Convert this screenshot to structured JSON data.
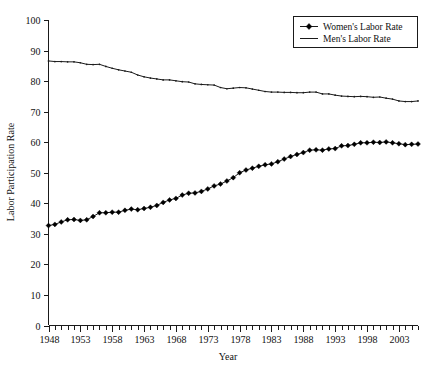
{
  "chart_data": {
    "type": "line",
    "title": "",
    "xlabel": "Year",
    "ylabel": "Labor Participation Rate",
    "xlim": [
      1948,
      2006
    ],
    "ylim": [
      0,
      100
    ],
    "grid": false,
    "legend_position": "upper-right",
    "y_ticks": [
      0,
      10,
      20,
      30,
      40,
      50,
      60,
      70,
      80,
      90,
      100
    ],
    "x_ticks": [
      1948,
      1953,
      1958,
      1963,
      1968,
      1973,
      1978,
      1983,
      1988,
      1993,
      1998,
      2003
    ],
    "x_minor_step": 1,
    "x": [
      1948,
      1949,
      1950,
      1951,
      1952,
      1953,
      1954,
      1955,
      1956,
      1957,
      1958,
      1959,
      1960,
      1961,
      1962,
      1963,
      1964,
      1965,
      1966,
      1967,
      1968,
      1969,
      1970,
      1971,
      1972,
      1973,
      1974,
      1975,
      1976,
      1977,
      1978,
      1979,
      1980,
      1981,
      1982,
      1983,
      1984,
      1985,
      1986,
      1987,
      1988,
      1989,
      1990,
      1991,
      1992,
      1993,
      1994,
      1995,
      1996,
      1997,
      1998,
      1999,
      2000,
      2001,
      2002,
      2003,
      2004,
      2005,
      2006
    ],
    "series": [
      {
        "name": "Women's Labor Rate",
        "marker": "diamond",
        "color": "#000000",
        "values": [
          32.7,
          33.1,
          33.9,
          34.6,
          34.7,
          34.4,
          34.6,
          35.7,
          36.9,
          36.9,
          37.1,
          37.1,
          37.7,
          38.1,
          37.9,
          38.3,
          38.7,
          39.3,
          40.3,
          41.1,
          41.6,
          42.7,
          43.3,
          43.4,
          43.9,
          44.7,
          45.7,
          46.3,
          47.3,
          48.4,
          50.0,
          50.9,
          51.5,
          52.1,
          52.6,
          52.9,
          53.6,
          54.5,
          55.3,
          56.0,
          56.6,
          57.4,
          57.5,
          57.4,
          57.8,
          57.9,
          58.8,
          58.9,
          59.3,
          59.8,
          59.8,
          60.0,
          59.9,
          60.1,
          59.8,
          59.5,
          59.2,
          59.3,
          59.4
        ]
      },
      {
        "name": "Men's Labor Rate",
        "marker": "none",
        "color": "#1a1a1a",
        "values": [
          86.6,
          86.4,
          86.4,
          86.3,
          86.3,
          86.0,
          85.5,
          85.4,
          85.5,
          84.8,
          84.2,
          83.7,
          83.3,
          82.9,
          82.0,
          81.4,
          81.0,
          80.7,
          80.4,
          80.4,
          80.1,
          79.8,
          79.7,
          79.1,
          78.9,
          78.8,
          78.7,
          77.9,
          77.5,
          77.7,
          77.9,
          77.8,
          77.4,
          77.0,
          76.6,
          76.4,
          76.4,
          76.3,
          76.3,
          76.2,
          76.2,
          76.4,
          76.4,
          75.8,
          75.8,
          75.4,
          75.1,
          75.0,
          74.9,
          75.0,
          74.9,
          74.7,
          74.8,
          74.4,
          74.1,
          73.5,
          73.3,
          73.3,
          73.5
        ]
      }
    ]
  },
  "legend": {
    "entries": [
      {
        "label": "Women's Labor Rate",
        "marker": "diamond-line-marker"
      },
      {
        "label": "Men's Labor Rate",
        "marker": "plain-line-marker"
      }
    ]
  },
  "axes": {
    "y_title": "Labor Participation Rate",
    "x_title": "Year",
    "y_tick_labels": [
      "0",
      "10",
      "20",
      "30",
      "40",
      "50",
      "60",
      "70",
      "80",
      "90",
      "100"
    ],
    "x_tick_labels": [
      "1948",
      "1953",
      "1958",
      "1963",
      "1968",
      "1973",
      "1978",
      "1983",
      "1988",
      "1993",
      "1998",
      "2003"
    ]
  }
}
